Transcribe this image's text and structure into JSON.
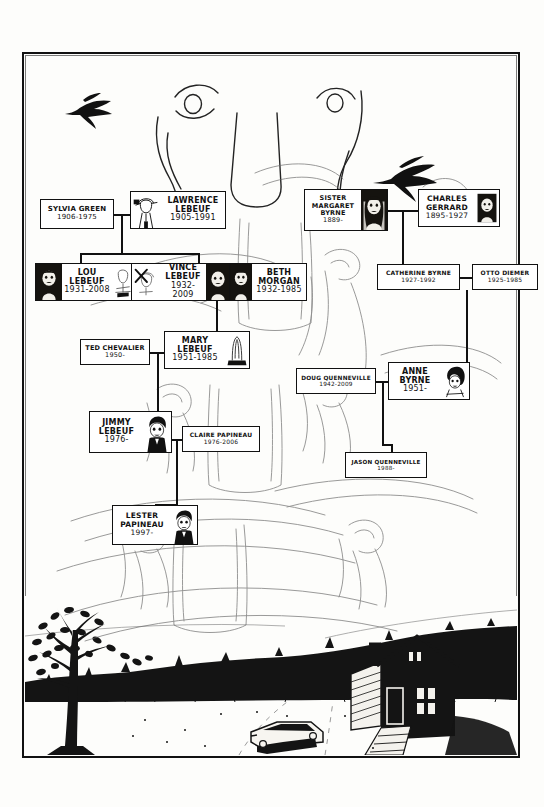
{
  "page": {
    "kind": "hand-drawn comic family tree page",
    "border_color": "#111111",
    "paper_color": "#fdfdfb",
    "ink_color": "#111111"
  },
  "tree": {
    "title": "",
    "nodes": [
      {
        "id": "sylvia-green",
        "name": "SYLVIA GREEN",
        "dates": "1906-1975",
        "portrait": "none"
      },
      {
        "id": "lawrence-lebeuf",
        "name": "LAWRENCE\nLEBEUF",
        "name_l1": "LAWRENCE",
        "name_l2": "LEBEUF",
        "dates": "1905-1991",
        "portrait": "man-sketch-left"
      },
      {
        "id": "lou-lebeuf",
        "name_l1": "LOU",
        "name_l2": "LEBEUF",
        "dates": "1931-2008",
        "portrait": "photo-dark-left"
      },
      {
        "id": "vince-lebeuf",
        "name_l1": "VINCE",
        "name_l2": "LEBEUF",
        "dates": "1932-2009",
        "portrait": "crossed-out-left"
      },
      {
        "id": "beth-morgan",
        "name_l1": "BETH",
        "name_l2": "MORGAN",
        "dates": "1932-1985",
        "portrait": "photo-dark-left"
      },
      {
        "id": "sister-margaret-byrne",
        "name_l1": "SISTER MARGARET",
        "name_l2": "BYRNE",
        "dates": "1889-",
        "portrait": "nun-dark-right"
      },
      {
        "id": "charles-gerrard",
        "name_l1": "CHARLES",
        "name_l2": "GERRARD",
        "dates": "1895-1927",
        "portrait": "photo-dark-right"
      },
      {
        "id": "catherine-byrne",
        "name_l1": "CATHERINE BYRNE",
        "name_l2": "",
        "dates": "1927-1992",
        "portrait": "none"
      },
      {
        "id": "otto-diemer",
        "name_l1": "OTTO DIEMER",
        "name_l2": "",
        "dates": "1925-1985",
        "portrait": "none"
      },
      {
        "id": "ted-chevalier",
        "name_l1": "TED CHEVALIER",
        "name_l2": "",
        "dates": "1950-",
        "portrait": "none"
      },
      {
        "id": "mary-lebeuf",
        "name_l1": "MARY",
        "name_l2": "LEBEUF",
        "dates": "1951-1985",
        "portrait": "gravestone-right"
      },
      {
        "id": "anne-byrne",
        "name_l1": "ANNE",
        "name_l2": "BYRNE",
        "dates": "1951-",
        "portrait": "woman-dark-right"
      },
      {
        "id": "doug-quenneville",
        "name_l1": "DOUG QUENNEVILLE",
        "name_l2": "",
        "dates": "1942-2009",
        "portrait": "none"
      },
      {
        "id": "jimmy-lebeuf",
        "name_l1": "JIMMY",
        "name_l2": "LEBEUF",
        "dates": "1976-",
        "portrait": "boy-dark-right"
      },
      {
        "id": "claire-papineau",
        "name_l1": "CLAIRE PAPINEAU",
        "name_l2": "",
        "dates": "1976-2006",
        "portrait": "none"
      },
      {
        "id": "jason-quenneville",
        "name_l1": "JASON QUENNEVILLE",
        "name_l2": "",
        "dates": "1988-",
        "portrait": "none"
      },
      {
        "id": "lester-papineau",
        "name_l1": "LESTER",
        "name_l2": "PAPINEAU",
        "dates": "1997-",
        "portrait": "boy-dark-right"
      }
    ]
  },
  "artwork": {
    "top_scene": "faint pencil sketch of a large face — two eyes and a nose bridge — with inked birds flying across",
    "mid_scene": "faint pencil sketches of tree trunks, gravestones and swirling hair/foliage forms behind the chart",
    "bottom_scene": "inked night landscape: bare tree at left, dark treeline, a clapboard farmhouse at right with lit windows, and a car on a gravel driveway",
    "birds": 3
  }
}
